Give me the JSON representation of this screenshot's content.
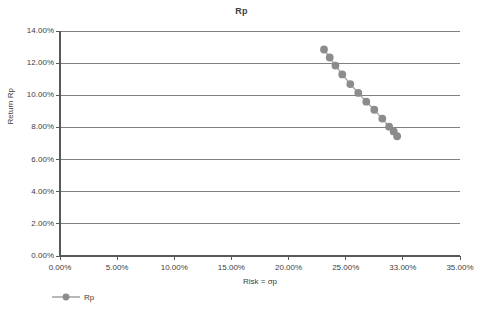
{
  "chart_data": {
    "type": "scatter",
    "title": "Rp",
    "xlabel": "Risk = σp",
    "ylabel": "Return Rp",
    "xlim": [
      0,
      35
    ],
    "ylim": [
      0,
      14
    ],
    "grid": "horizontal",
    "legend_position": "bottom-left",
    "marker_color": "#8c8c8c",
    "line_color": "#a6a6a6",
    "axis_color": "#595959",
    "gridline_color": "#808080",
    "x_tick_labels": [
      "0.00%",
      "5.00%",
      "10.00%",
      "15.00%",
      "20.00%",
      "25.00%",
      "33.00%",
      "35.00%"
    ],
    "x_tick_values": [
      0,
      5,
      10,
      15,
      20,
      25,
      30,
      35
    ],
    "y_tick_labels": [
      "0.00%",
      "2.00%",
      "4.00%",
      "6.00%",
      "8.00%",
      "10.00%",
      "12.00%",
      "14.00%"
    ],
    "y_tick_values": [
      0,
      2,
      4,
      6,
      8,
      10,
      12,
      14
    ],
    "series": [
      {
        "name": "Rp",
        "x": [
          23.1,
          23.6,
          24.1,
          24.7,
          25.4,
          26.1,
          26.8,
          27.5,
          28.2,
          28.8,
          29.2,
          29.5
        ],
        "y": [
          12.85,
          12.35,
          11.85,
          11.3,
          10.7,
          10.15,
          9.6,
          9.1,
          8.55,
          8.05,
          7.75,
          7.45
        ]
      }
    ],
    "legend": [
      {
        "label": "Rp",
        "color": "#8c8c8c"
      }
    ]
  }
}
